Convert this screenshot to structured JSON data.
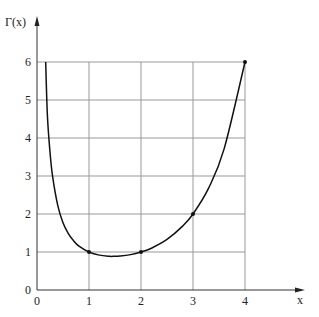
{
  "chart_data": {
    "type": "line",
    "title": "",
    "xlabel": "x",
    "ylabel": "Γ(x)",
    "xlim": [
      0,
      4
    ],
    "ylim": [
      0,
      6
    ],
    "grid": true,
    "x_ticks": [
      "0",
      "1",
      "2",
      "3",
      "4"
    ],
    "y_ticks": [
      "0",
      "1",
      "2",
      "3",
      "4",
      "5",
      "6"
    ],
    "series": [
      {
        "name": "Γ(x)",
        "x": [
          0.167,
          0.2,
          0.25,
          0.3,
          0.4,
          0.5,
          0.6,
          0.7,
          0.8,
          1.0,
          1.2,
          1.4,
          1.46,
          1.6,
          1.8,
          2.0,
          2.2,
          2.5,
          2.8,
          3.0,
          3.3,
          3.6,
          4.0
        ],
        "values": [
          6.0,
          4.59,
          3.63,
          2.99,
          2.22,
          1.77,
          1.49,
          1.3,
          1.16,
          1.0,
          0.918,
          0.887,
          0.886,
          0.894,
          0.931,
          1.0,
          1.1,
          1.33,
          1.68,
          2.0,
          2.68,
          3.72,
          6.0
        ]
      }
    ],
    "marked_points": [
      {
        "x": 1,
        "y": 1
      },
      {
        "x": 2,
        "y": 1
      },
      {
        "x": 3,
        "y": 2
      },
      {
        "x": 4,
        "y": 6
      }
    ]
  },
  "axes": {
    "x_label": "x",
    "y_label": "Γ(x)"
  }
}
